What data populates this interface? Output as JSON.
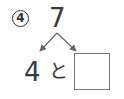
{
  "problem": {
    "number": "4",
    "total": "7",
    "known_part": "4",
    "connector": "と",
    "answer": ""
  },
  "colors": {
    "ink": "#3a3a3a",
    "arrow": "#666666",
    "box_border": "#777777"
  }
}
